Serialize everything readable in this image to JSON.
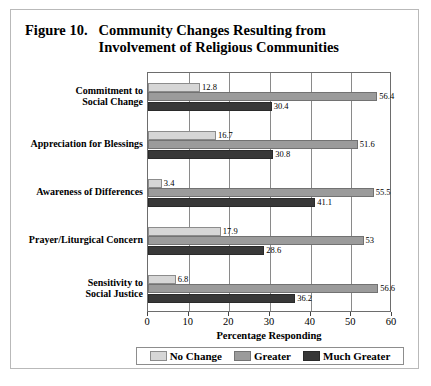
{
  "figure": {
    "number_label": "Figure 10.",
    "title_line1": "Community Changes Resulting from",
    "title_line2": "Involvement of Religious Communities"
  },
  "colors": {
    "no_change": "#d6d6d6",
    "greater": "#9b9b9b",
    "much_greater": "#383838",
    "axis": "#6d6d6d",
    "gridline": "#8a8a8a",
    "frame": "#b9b9b9"
  },
  "chart_data": {
    "type": "bar",
    "orientation": "horizontal",
    "title": "Figure 10. Community Changes Resulting from Involvement of Religious Communities",
    "xlabel": "Percentage Responding",
    "ylabel": "",
    "xlim": [
      0,
      60
    ],
    "xticks": [
      0,
      10,
      20,
      30,
      40,
      50,
      60
    ],
    "xtick_labels": [
      "0",
      "10",
      "20",
      "30",
      "40",
      "50",
      "60"
    ],
    "grid": true,
    "legend_position": "bottom",
    "categories": [
      "Commitment to Social Change",
      "Appreciation for Blessings",
      "Awareness of Differences",
      "Prayer/Liturgical Concern",
      "Sensitivity to Social Justice"
    ],
    "category_lines": [
      [
        "Commitment to",
        "Social Change"
      ],
      [
        "Appreciation for Blessings"
      ],
      [
        "Awareness of Differences"
      ],
      [
        "Prayer/Liturgical Concern"
      ],
      [
        "Sensitivity to",
        "Social Justice"
      ]
    ],
    "series": [
      {
        "name": "No Change",
        "color": "#d6d6d6",
        "values": [
          12.8,
          16.7,
          3.4,
          17.9,
          6.8
        ],
        "labels": [
          "12.8",
          "16.7",
          "3.4",
          "17.9",
          "6.8"
        ]
      },
      {
        "name": "Greater",
        "color": "#9b9b9b",
        "values": [
          56.4,
          51.6,
          55.5,
          53,
          56.6
        ],
        "labels": [
          "56.4",
          "51.6",
          "55.5",
          "53",
          "56.6"
        ]
      },
      {
        "name": "Much Greater",
        "color": "#383838",
        "values": [
          30.4,
          30.8,
          41.1,
          28.6,
          36.2
        ],
        "labels": [
          "30.4",
          "30.8",
          "41.1",
          "28.6",
          "36.2"
        ]
      }
    ]
  }
}
